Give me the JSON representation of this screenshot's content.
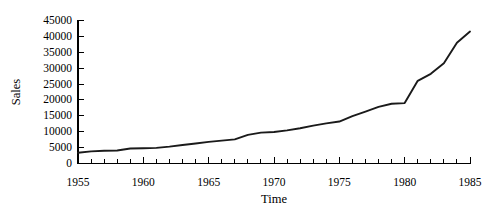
{
  "chart_data": {
    "type": "line",
    "title": "",
    "xlabel": "Time",
    "ylabel": "Sales",
    "xlim": [
      1955,
      1985
    ],
    "ylim": [
      0,
      45000
    ],
    "grid": false,
    "legend": null,
    "x_tick_labels": [
      "1955",
      "1960",
      "1965",
      "1970",
      "1975",
      "1980",
      "1985"
    ],
    "x_major_ticks": [
      1955,
      1960,
      1965,
      1970,
      1975,
      1980,
      1985
    ],
    "x_minor_tick_step": 1,
    "y_tick_labels": [
      "0",
      "5000",
      "10000",
      "15000",
      "20000",
      "25000",
      "30000",
      "35000",
      "40000",
      "45000"
    ],
    "y_major_ticks": [
      0,
      5000,
      10000,
      15000,
      20000,
      25000,
      30000,
      35000,
      40000,
      45000
    ],
    "line_color": "#1a1a1a",
    "x": [
      1955,
      1956,
      1957,
      1958,
      1959,
      1960,
      1961,
      1962,
      1963,
      1964,
      1965,
      1966,
      1967,
      1968,
      1969,
      1970,
      1971,
      1972,
      1973,
      1974,
      1975,
      1976,
      1977,
      1978,
      1979,
      1980,
      1981,
      1982,
      1983,
      1984,
      1985
    ],
    "values": [
      3400,
      3800,
      4000,
      4100,
      4700,
      4800,
      4900,
      5300,
      5800,
      6300,
      6800,
      7200,
      7600,
      9000,
      9700,
      9900,
      10400,
      11100,
      11900,
      12600,
      13200,
      14900,
      16300,
      17800,
      18800,
      19000,
      26000,
      28200,
      31500,
      38000,
      41500
    ]
  }
}
